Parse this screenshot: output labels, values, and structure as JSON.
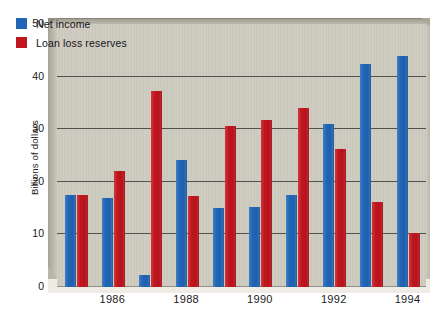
{
  "chart_data": {
    "type": "bar",
    "title": "",
    "xlabel": "",
    "ylabel": "Billions of dollars",
    "ylim": [
      0,
      50
    ],
    "yticks": [
      0,
      10,
      20,
      30,
      40,
      50
    ],
    "ytick_labels": [
      "0",
      "10",
      "20",
      "30",
      "40",
      "50"
    ],
    "grid": true,
    "legend_position": "top-left",
    "categories": [
      "1985",
      "1986",
      "1987",
      "1988",
      "1989",
      "1990",
      "1991",
      "1992",
      "1993",
      "1994"
    ],
    "xtick_labels_shown": [
      "1986",
      "1988",
      "1990",
      "1992",
      "1994"
    ],
    "series": [
      {
        "name": "Net income",
        "color": "#2265b5",
        "values": [
          17.5,
          17.0,
          2.2,
          24.2,
          15.0,
          15.3,
          17.5,
          31.0,
          42.4,
          44.0
        ]
      },
      {
        "name": "Loan loss reserves",
        "color": "#c0161f",
        "values": [
          17.5,
          22.0,
          37.3,
          17.3,
          30.6,
          31.8,
          34.0,
          26.3,
          16.2,
          10.3
        ]
      }
    ]
  },
  "legend": {
    "items": [
      {
        "label": "Net income",
        "color": "#2265b5"
      },
      {
        "label": "Loan loss reserves",
        "color": "#c0161f"
      }
    ]
  },
  "axes": {
    "y_title": "Billions of dollars"
  },
  "colors": {
    "plot_background": "#cecbbf",
    "frame": "#b3b0a4",
    "gridline": "#3b3b38",
    "blue": "#2265b5",
    "red": "#c0161f"
  }
}
